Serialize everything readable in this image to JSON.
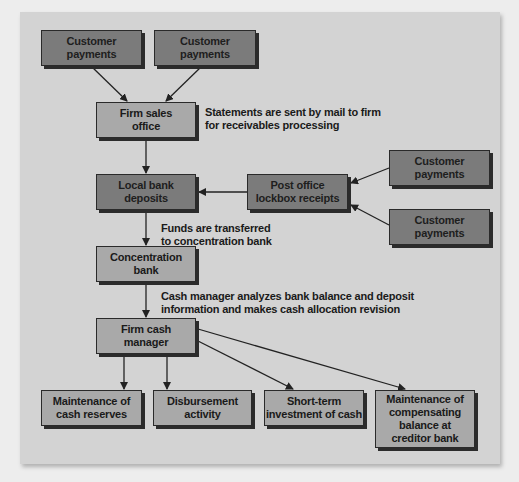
{
  "diagram": {
    "type": "flowchart",
    "title": "",
    "nodes": [
      {
        "id": "cp1",
        "label": "Customer\npayments",
        "shade": "dark"
      },
      {
        "id": "cp2",
        "label": "Customer\npayments",
        "shade": "dark"
      },
      {
        "id": "sales",
        "label": "Firm sales\noffice",
        "shade": "mid"
      },
      {
        "id": "local",
        "label": "Local bank\ndeposits",
        "shade": "dark"
      },
      {
        "id": "lockbox",
        "label": "Post office\nlockbox receipts",
        "shade": "dark"
      },
      {
        "id": "cp3",
        "label": "Customer\npayments",
        "shade": "dark"
      },
      {
        "id": "cp4",
        "label": "Customer\npayments",
        "shade": "dark"
      },
      {
        "id": "conc",
        "label": "Concentration\nbank",
        "shade": "mid"
      },
      {
        "id": "cashmgr",
        "label": "Firm cash\nmanager",
        "shade": "mid"
      },
      {
        "id": "reserves",
        "label": "Maintenance of\ncash reserves",
        "shade": "mid"
      },
      {
        "id": "disb",
        "label": "Disbursement\nactivity",
        "shade": "mid"
      },
      {
        "id": "shortterm",
        "label": "Short-term\ninvestment of cash",
        "shade": "mid"
      },
      {
        "id": "compbal",
        "label": "Maintenance of\ncompensating\nbalance at\ncreditor bank",
        "shade": "mid"
      }
    ],
    "annotations": [
      {
        "id": "statements",
        "text": "Statements are sent by mail to firm\nfor receivables processing"
      },
      {
        "id": "funds",
        "text": "Funds are transferred\nto concentration bank"
      },
      {
        "id": "analyzes",
        "text": "Cash manager analyzes bank balance and deposit\ninformation and makes cash allocation revision"
      }
    ],
    "edges": [
      {
        "from": "cp1",
        "to": "sales"
      },
      {
        "from": "cp2",
        "to": "sales"
      },
      {
        "from": "sales",
        "to": "local"
      },
      {
        "from": "cp3",
        "to": "lockbox"
      },
      {
        "from": "cp4",
        "to": "lockbox"
      },
      {
        "from": "lockbox",
        "to": "local"
      },
      {
        "from": "local",
        "to": "conc"
      },
      {
        "from": "conc",
        "to": "cashmgr"
      },
      {
        "from": "cashmgr",
        "to": "reserves"
      },
      {
        "from": "cashmgr",
        "to": "disb"
      },
      {
        "from": "cashmgr",
        "to": "shortterm"
      },
      {
        "from": "cashmgr",
        "to": "compbal"
      }
    ],
    "colors": {
      "background": "#ededed",
      "panel": "#d3d3d3",
      "dark_box": "#7b7b7b",
      "mid_box": "#a9a9a9",
      "line": "#222222"
    }
  }
}
